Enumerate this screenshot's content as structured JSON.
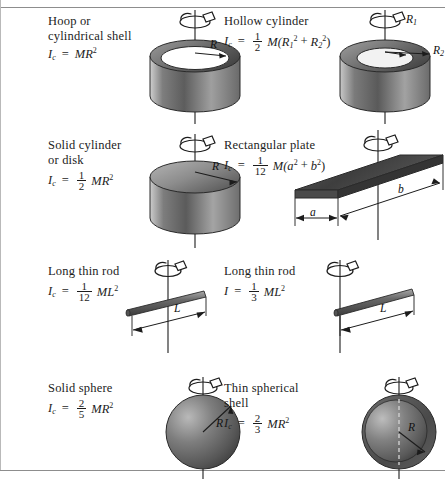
{
  "figure": {
    "title_hidden": "",
    "rows": 4,
    "columns": 2
  },
  "items": [
    {
      "name": "hoop",
      "caption_line1": "Hoop or",
      "caption_line2": "cylindrical shell",
      "symbol": "I",
      "subscript": "c",
      "equals": "=",
      "coefficient": null,
      "body": "MR",
      "exponent": "2",
      "dimension_labels": [
        "R"
      ],
      "axis": "central vertical"
    },
    {
      "name": "hollow-cylinder",
      "caption_line1": "Hollow cylinder",
      "caption_line2": "",
      "symbol": "I",
      "subscript": "c",
      "equals": "=",
      "numerator": "1",
      "denominator": "2",
      "body": "M(R",
      "sub1": "1",
      "sup1": "2",
      "plus": "+",
      "sub2": "2",
      "sup2": "2",
      "close": ")",
      "dimension_labels": [
        "R1",
        "R2"
      ],
      "axis": "central vertical"
    },
    {
      "name": "solid-cylinder",
      "caption_line1": "Solid cylinder",
      "caption_line2": "or disk",
      "symbol": "I",
      "subscript": "c",
      "equals": "=",
      "numerator": "1",
      "denominator": "2",
      "body": "MR",
      "exponent": "2",
      "dimension_labels": [
        "R"
      ],
      "axis": "central vertical"
    },
    {
      "name": "rectangular-plate",
      "caption_line1": "Rectangular plate",
      "caption_line2": "",
      "symbol": "I",
      "subscript": "c",
      "equals": "=",
      "numerator": "1",
      "denominator": "12",
      "body": "M(a",
      "exponent": "2",
      "plus": "+",
      "body2": "b",
      "exponent2": "2",
      "close": ")",
      "dimension_labels": [
        "a",
        "b"
      ],
      "axis": "central vertical"
    },
    {
      "name": "long-thin-rod-center",
      "caption_line1": "Long thin rod",
      "caption_line2": "",
      "symbol": "I",
      "subscript": "c",
      "equals": "=",
      "numerator": "1",
      "denominator": "12",
      "body": "ML",
      "exponent": "2",
      "dimension_labels": [
        "L"
      ],
      "axis": "through center"
    },
    {
      "name": "long-thin-rod-end",
      "caption_line1": "Long thin rod",
      "caption_line2": "",
      "symbol": "I",
      "subscript": "",
      "equals": "=",
      "numerator": "1",
      "denominator": "3",
      "body": "ML",
      "exponent": "2",
      "dimension_labels": [
        "L"
      ],
      "axis": "through end"
    },
    {
      "name": "solid-sphere",
      "caption_line1": "Solid sphere",
      "caption_line2": "",
      "symbol": "I",
      "subscript": "c",
      "equals": "=",
      "numerator": "2",
      "denominator": "5",
      "body": "MR",
      "exponent": "2",
      "dimension_labels": [
        "R"
      ],
      "axis": "central vertical"
    },
    {
      "name": "thin-spherical-shell",
      "caption_line1": "Thin spherical",
      "caption_line2": "shell",
      "symbol": "I",
      "subscript": "c",
      "equals": "=",
      "numerator": "2",
      "denominator": "3",
      "body": "MR",
      "exponent": "2",
      "dimension_labels": [
        "R"
      ],
      "axis": "central vertical"
    }
  ],
  "colors": {
    "ink": "#1c1c1c",
    "rule": "#8d8d8d",
    "shape_dark": "#4a4a4a",
    "shape_mid": "#8a8a8a",
    "shape_light": "#d6d6d6",
    "plate_dark": "#3f3f3f",
    "background": "#ffffff"
  }
}
